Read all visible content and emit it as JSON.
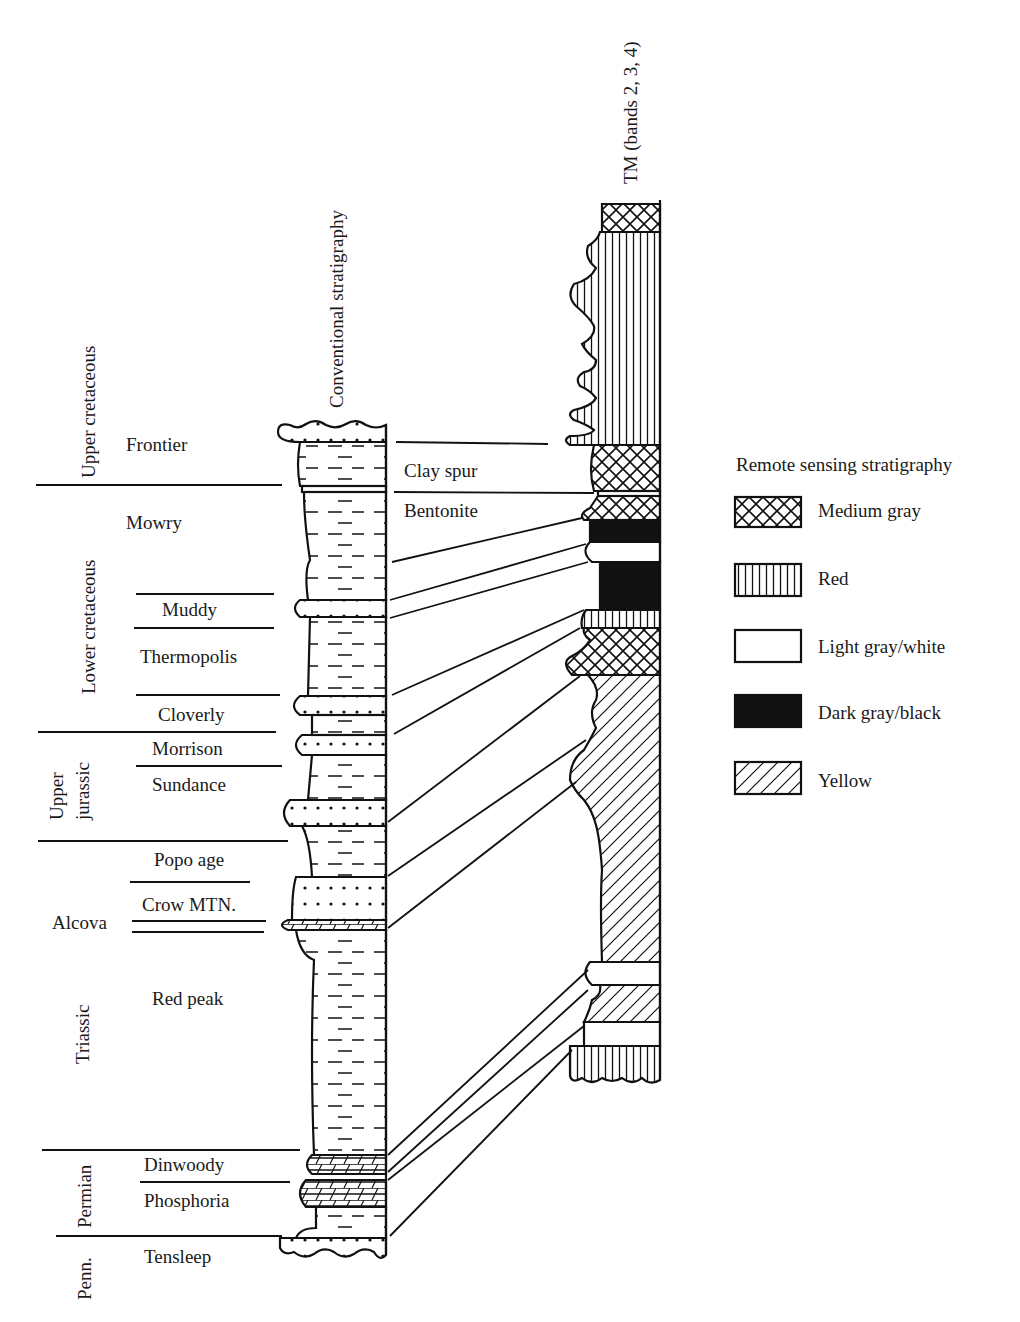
{
  "column_titles": {
    "conventional": "Conventional stratigraphy",
    "remote": "TM (bands 2, 3, 4)"
  },
  "periods": [
    {
      "label": "Upper cretaceous"
    },
    {
      "label": "Lower cretaceous"
    },
    {
      "label": "Upper jurassic",
      "lines": [
        "Upper",
        "jurassic"
      ]
    },
    {
      "label": "Alcova"
    },
    {
      "label": "Triassic"
    },
    {
      "label": "Permian"
    },
    {
      "label": "Penn."
    }
  ],
  "formations": [
    {
      "label": "Frontier"
    },
    {
      "label": "Mowry"
    },
    {
      "label": "Muddy"
    },
    {
      "label": "Thermopolis"
    },
    {
      "label": "Cloverly"
    },
    {
      "label": "Morrison"
    },
    {
      "label": "Sundance"
    },
    {
      "label": "Popo age"
    },
    {
      "label": "Crow MTN."
    },
    {
      "label": "Red peak"
    },
    {
      "label": "Dinwoody"
    },
    {
      "label": "Phosphoria"
    },
    {
      "label": "Tensleep"
    }
  ],
  "markers": [
    {
      "label": "Clay spur"
    },
    {
      "label": "Bentonite"
    }
  ],
  "legend": {
    "title": "Remote sensing stratigraphy",
    "items": [
      {
        "label": "Medium gray",
        "pattern": "crosshatch"
      },
      {
        "label": "Red",
        "pattern": "vertical-lines"
      },
      {
        "label": "Light gray/white",
        "pattern": "blank"
      },
      {
        "label": "Dark gray/black",
        "pattern": "solid-black"
      },
      {
        "label": "Yellow",
        "pattern": "diagonal-lines"
      }
    ]
  }
}
